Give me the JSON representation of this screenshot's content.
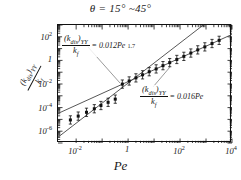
{
  "title": {
    "theta": "θ = 15°  ~45°"
  },
  "axes": {
    "xlabel": "Pe",
    "ylabel_numerator": "(k",
    "ylabel_num_sub": "dis",
    "ylabel_num_close": ")",
    "ylabel_num_sub2": "YY",
    "ylabel_denominator": "k",
    "ylabel_den_sub": "f",
    "xticks": [
      "10",
      "1",
      "10",
      "10"
    ],
    "xtick_exp": [
      "-2",
      "",
      "2",
      "4"
    ],
    "yticks": [
      "10",
      "1",
      "10",
      "10",
      "10"
    ],
    "ytick_exp": [
      "2",
      "",
      "-2",
      "-4",
      "-6"
    ]
  },
  "annotations": {
    "a1": {
      "num": "(k",
      "num_sub": "dis",
      "num_close": ")",
      "num_sub2": "YY",
      "den": "k",
      "den_sub": "f",
      "eq": "= 0.012Pe",
      "exp": "1.7"
    },
    "a2": {
      "num": "(k",
      "num_sub": "dis",
      "num_close": ")",
      "num_sub2": "YY",
      "den": "k",
      "den_sub": "f",
      "eq": "= 0.016Pe",
      "exp": ""
    }
  },
  "chart_data": {
    "type": "scatter",
    "title": "θ = 15° ~45°",
    "xlabel": "Pe",
    "ylabel": "(k_dis)_YY / k_f",
    "xscale": "log",
    "yscale": "log",
    "xlim": [
      0.002,
      10000
    ],
    "ylim": [
      1e-07,
      1000
    ],
    "grid": false,
    "legend": "none",
    "series": [
      {
        "name": "(k_dis)_YY / k_f data",
        "marker": "filled-square-with-errorbars",
        "x": [
          0.006,
          0.012,
          0.025,
          0.05,
          0.09,
          0.17,
          0.32,
          0.6,
          1.1,
          2.0,
          3.6,
          6.5,
          12,
          22,
          40,
          75,
          140,
          260,
          480,
          900,
          1700,
          3200
        ],
        "y": [
          9e-06,
          1.9e-05,
          4e-05,
          8e-05,
          0.00015,
          0.00028,
          0.00052,
          0.0098,
          0.018,
          0.033,
          0.06,
          0.11,
          0.19,
          0.36,
          0.65,
          1.2,
          2.2,
          4.2,
          7.8,
          14,
          27,
          50
        ],
        "yerr_decades": 0.35
      }
    ],
    "fits": [
      {
        "name": "steep fit",
        "label": "(k_dis)_YY / k_f = 0.012 Pe^1.7",
        "coefficient": 0.012,
        "exponent": 1.7
      },
      {
        "name": "linear fit",
        "label": "(k_dis)_YY / k_f = 0.016 Pe",
        "coefficient": 0.016,
        "exponent": 1.0
      }
    ]
  }
}
